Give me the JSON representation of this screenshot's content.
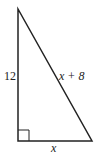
{
  "diagram": {
    "type": "right-triangle",
    "vertices": {
      "top": [
        18,
        9
      ],
      "bottom_left": [
        18,
        141
      ],
      "bottom_right": [
        92,
        141
      ]
    },
    "right_angle_at": "bottom_left",
    "labels": {
      "vertical_leg": "12",
      "hypotenuse": "x + 8",
      "horizontal_leg": "x"
    },
    "stroke_color": "#222222"
  }
}
